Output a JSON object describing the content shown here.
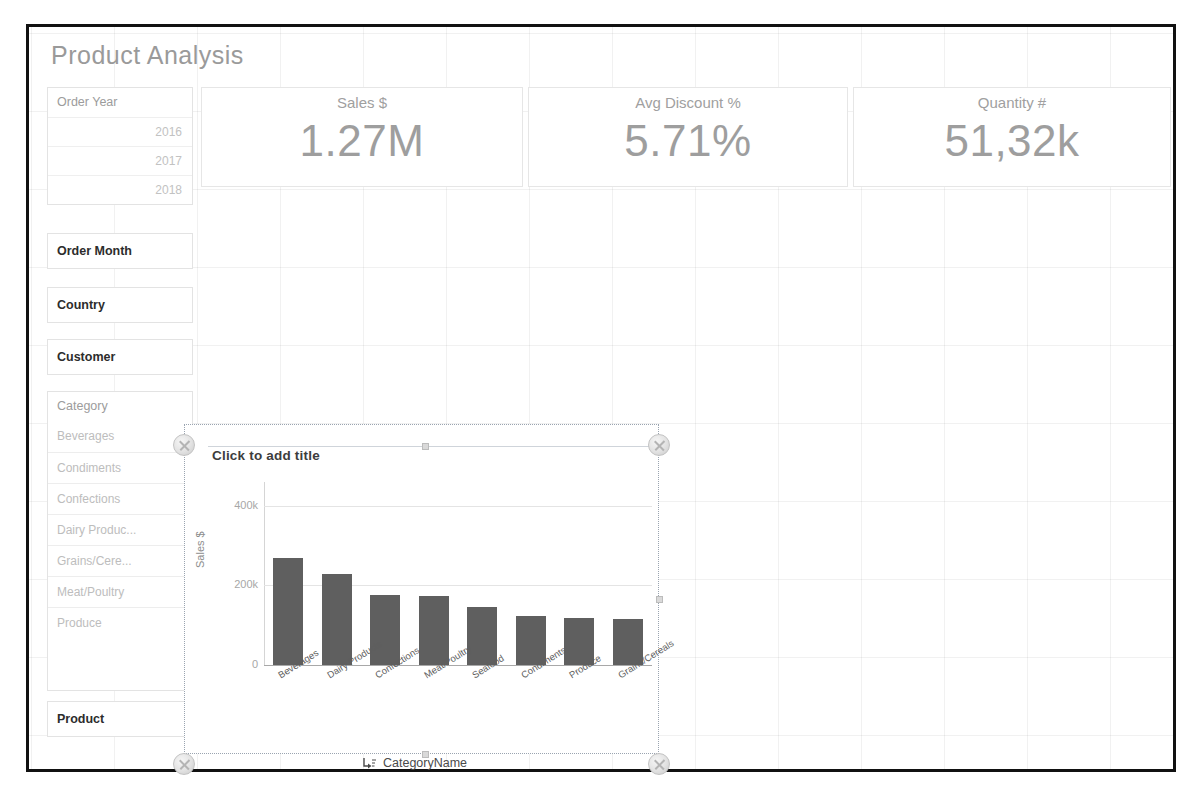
{
  "page": {
    "title": "Product Analysis"
  },
  "filters": [
    {
      "name": "order-year",
      "label": "Order Year",
      "bold": false,
      "values": [
        "2016",
        "2017",
        "2018"
      ]
    },
    {
      "name": "order-month",
      "label": "Order Month",
      "bold": true,
      "values": []
    },
    {
      "name": "country",
      "label": "Country",
      "bold": true,
      "values": []
    },
    {
      "name": "customer",
      "label": "Customer",
      "bold": true,
      "values": []
    }
  ],
  "category_filter": {
    "label": "Category",
    "items": [
      "Beverages",
      "Condiments",
      "Confections",
      "Dairy Produc...",
      "Grains/Cere...",
      "Meat/Poultry",
      "Produce"
    ]
  },
  "product_filter": {
    "label": "Product"
  },
  "kpis": [
    {
      "name": "sales",
      "label": "Sales $",
      "value": "1.27M"
    },
    {
      "name": "avg-discount",
      "label": "Avg Discount %",
      "value": "5.71%"
    },
    {
      "name": "quantity",
      "label": "Quantity #",
      "value": "51,32k"
    }
  ],
  "chart_object": {
    "title_placeholder": "Click to add title"
  },
  "chart_data": {
    "type": "bar",
    "title": "Click to add title",
    "xlabel": "CategoryName",
    "ylabel": "Sales $",
    "categories": [
      "Beverages",
      "Dairy Products",
      "Confections",
      "Meat/Poultry",
      "Seafood",
      "Condiments",
      "Produce",
      "Grains/Cereals"
    ],
    "values": [
      268000,
      229000,
      177000,
      173000,
      145000,
      122000,
      118000,
      115000
    ],
    "ylim": [
      0,
      460000
    ],
    "yticks": [
      0,
      200000,
      400000
    ],
    "ytick_labels": [
      "0",
      "200k",
      "400k"
    ],
    "grid": true,
    "legend": "none",
    "bar_color": "#5f5f5f"
  },
  "icons": {
    "drill": "drill-down-icon"
  }
}
